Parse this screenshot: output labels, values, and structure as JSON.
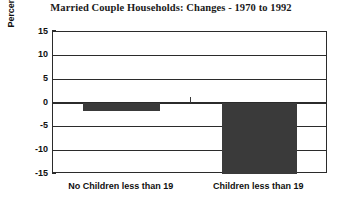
{
  "chart_data": {
    "type": "bar",
    "title": "Married Couple Households: Changes - 1970 to 1992",
    "xlabel": "",
    "ylabel": "Percentage Point Change",
    "categories": [
      "No Children less than 19",
      "Children less than 19"
    ],
    "values": [
      -1.7,
      -15.0
    ],
    "ylim": [
      -15,
      15
    ],
    "yticks": [
      15,
      10,
      5,
      0,
      -5,
      -10,
      -15
    ],
    "ytick_labels": [
      "15",
      "10",
      "5",
      "0",
      "-5",
      "-10",
      "-15"
    ],
    "grid": true,
    "legend": null,
    "bar_color": "#3a3a3a",
    "axis_color": "#2b2b2b",
    "background": "#ffffff"
  },
  "figure": {
    "title": "Married Couple Households: Changes - 1970 to 1992",
    "y_axis_title": "Percentage Point Change"
  }
}
